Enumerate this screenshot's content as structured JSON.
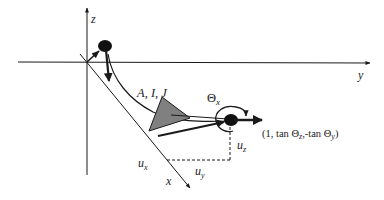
{
  "diagram": {
    "axes": {
      "z_label": "z",
      "y_label": "y",
      "x_label": "x"
    },
    "labels": {
      "params": "A, I, J",
      "theta_x": "Θ",
      "theta_x_sub": "x",
      "direction_vector": "(1, tan Θz,-tan Θy)",
      "u_x": "u",
      "u_x_sub": "x",
      "u_y": "u",
      "u_y_sub": "y",
      "u_z": "u",
      "u_z_sub": "z"
    },
    "colors": {
      "line": "#1a1a1a",
      "triangle_fill": "#808080",
      "node_fill": "#111111"
    }
  }
}
